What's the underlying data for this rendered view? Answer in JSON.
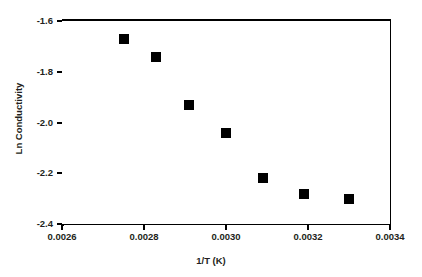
{
  "chart_data": {
    "type": "scatter",
    "title": "",
    "xlabel": "1/T (K)",
    "ylabel": "Ln Conductivity",
    "xlim": [
      0.0026,
      0.0034
    ],
    "ylim": [
      -2.4,
      -1.6
    ],
    "xticks": [
      0.0026,
      0.0028,
      0.003,
      0.0032,
      0.0034
    ],
    "xtick_labels": [
      "0.0026",
      "0.0028",
      "0.0030",
      "0.0032",
      "0.0034"
    ],
    "yticks": [
      -1.6,
      -1.8,
      -2.0,
      -2.2,
      -2.4
    ],
    "ytick_labels": [
      "-1.6",
      "-1.8",
      "-2.0",
      "-2.2",
      "-2.4"
    ],
    "grid": false,
    "legend": null,
    "marker": "square",
    "marker_color": "#000000",
    "series": [
      {
        "name": "Ln Conductivity",
        "x": [
          0.00275,
          0.00283,
          0.00291,
          0.003,
          0.00309,
          0.00319,
          0.0033
        ],
        "y": [
          -1.67,
          -1.74,
          -1.93,
          -2.04,
          -2.22,
          -2.28,
          -2.3
        ]
      }
    ]
  },
  "axes": {
    "x": {
      "label": "1/T (K)",
      "ticks": [
        {
          "value": 0.0026,
          "label": "0.0026"
        },
        {
          "value": 0.0028,
          "label": "0.0028"
        },
        {
          "value": 0.003,
          "label": "0.0030"
        },
        {
          "value": 0.0032,
          "label": "0.0032"
        },
        {
          "value": 0.0034,
          "label": "0.0034"
        }
      ]
    },
    "y": {
      "label": "Ln Conductivity",
      "ticks": [
        {
          "value": -1.6,
          "label": "-1.6"
        },
        {
          "value": -1.8,
          "label": "-1.8"
        },
        {
          "value": -2.0,
          "label": "-2.0"
        },
        {
          "value": -2.2,
          "label": "-2.2"
        },
        {
          "value": -2.4,
          "label": "-2.4"
        }
      ]
    }
  },
  "style": {
    "background": "#ffffff",
    "axis_color": "#000000",
    "text_color": "#231f20",
    "marker_color": "#000000"
  }
}
